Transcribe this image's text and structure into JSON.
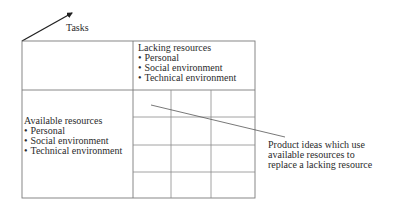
{
  "axis": {
    "label": "Tasks"
  },
  "lacking": {
    "title": "Lacking resources",
    "items": [
      "Personal",
      "Social environment",
      "Technical environment"
    ]
  },
  "available": {
    "title": "Available resources",
    "items": [
      "Personal",
      "Social environment",
      "Technical environment"
    ]
  },
  "matrix": {
    "columns": 3,
    "rows": 4
  },
  "annotation": {
    "lines": [
      "Product ideas which use",
      "available resources to",
      "replace a lacking resource"
    ]
  },
  "bullet": "•"
}
